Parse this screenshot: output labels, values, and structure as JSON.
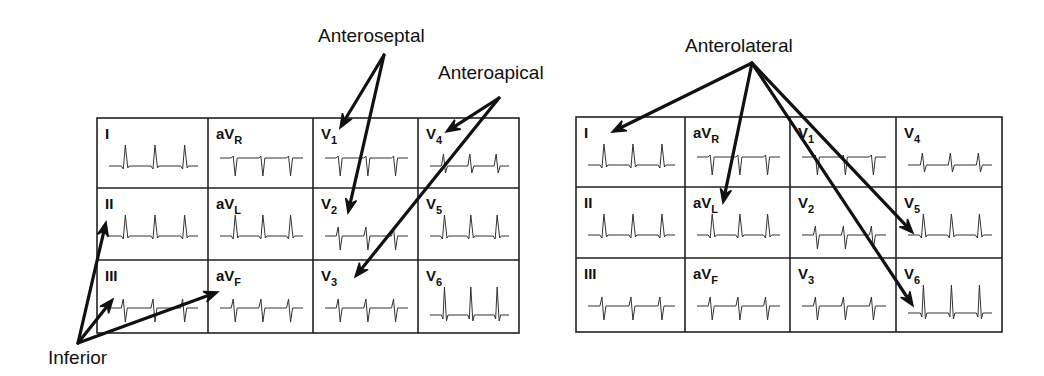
{
  "figure": {
    "panels": [
      {
        "id": "left",
        "grid": {
          "x": 97,
          "y": 118,
          "width": 422,
          "height": 215,
          "col_x": [
            97,
            208,
            313,
            418,
            519
          ],
          "row_y": [
            118,
            188,
            260,
            333
          ]
        },
        "leads": [
          {
            "label": "I",
            "sub": "",
            "row": 0,
            "col": 0,
            "wave": "upright"
          },
          {
            "label": "aV",
            "sub": "R",
            "row": 0,
            "col": 1,
            "wave": "inverted"
          },
          {
            "label": "V",
            "sub": "1",
            "row": 0,
            "col": 2,
            "wave": "inverted"
          },
          {
            "label": "V",
            "sub": "4",
            "row": 0,
            "col": 3,
            "wave": "biphasic_small"
          },
          {
            "label": "II",
            "sub": "",
            "row": 1,
            "col": 0,
            "wave": "upright"
          },
          {
            "label": "aV",
            "sub": "L",
            "row": 1,
            "col": 1,
            "wave": "upright"
          },
          {
            "label": "V",
            "sub": "2",
            "row": 1,
            "col": 2,
            "wave": "rS"
          },
          {
            "label": "V",
            "sub": "5",
            "row": 1,
            "col": 3,
            "wave": "upright"
          },
          {
            "label": "III",
            "sub": "",
            "row": 2,
            "col": 0,
            "wave": "rS"
          },
          {
            "label": "aV",
            "sub": "F",
            "row": 2,
            "col": 1,
            "wave": "rS"
          },
          {
            "label": "V",
            "sub": "3",
            "row": 2,
            "col": 2,
            "wave": "rS"
          },
          {
            "label": "V",
            "sub": "6",
            "row": 2,
            "col": 3,
            "wave": "tall"
          }
        ],
        "region_labels": [
          {
            "text": "Anteroseptal",
            "x": 318,
            "y": 26
          },
          {
            "text": "Anteroapical",
            "x": 438,
            "y": 63
          },
          {
            "text": "Inferior",
            "x": 48,
            "y": 348
          }
        ],
        "arrows": [
          {
            "name": "anteroseptal-to-v1",
            "from": [
              384,
              55
            ],
            "to": [
              340,
              128
            ]
          },
          {
            "name": "anteroseptal-to-v2",
            "from": [
              384,
              55
            ],
            "to": [
              348,
              213
            ]
          },
          {
            "name": "anteroapical-to-v4",
            "from": [
              499,
              98
            ],
            "to": [
              446,
              132
            ]
          },
          {
            "name": "anteroapical-to-v3",
            "from": [
              499,
              98
            ],
            "to": [
              355,
              277
            ]
          },
          {
            "name": "inferior-to-ii",
            "from": [
              78,
              343
            ],
            "to": [
              106,
              222
            ]
          },
          {
            "name": "inferior-to-iii",
            "from": [
              78,
              343
            ],
            "to": [
              113,
              299
            ]
          },
          {
            "name": "inferior-to-avf",
            "from": [
              78,
              343
            ],
            "to": [
              218,
              292
            ]
          }
        ]
      },
      {
        "id": "right",
        "grid": {
          "x": 576,
          "y": 117,
          "width": 426,
          "height": 215,
          "col_x": [
            576,
            685,
            790,
            896,
            1002
          ],
          "row_y": [
            117,
            187,
            258,
            332
          ]
        },
        "leads": [
          {
            "label": "I",
            "sub": "",
            "row": 0,
            "col": 0,
            "wave": "upright"
          },
          {
            "label": "aV",
            "sub": "R",
            "row": 0,
            "col": 1,
            "wave": "inverted"
          },
          {
            "label": "V",
            "sub": "1",
            "row": 0,
            "col": 2,
            "wave": "inverted"
          },
          {
            "label": "V",
            "sub": "4",
            "row": 0,
            "col": 3,
            "wave": "biphasic_small"
          },
          {
            "label": "II",
            "sub": "",
            "row": 1,
            "col": 0,
            "wave": "upright"
          },
          {
            "label": "aV",
            "sub": "L",
            "row": 1,
            "col": 1,
            "wave": "upright"
          },
          {
            "label": "V",
            "sub": "2",
            "row": 1,
            "col": 2,
            "wave": "rS"
          },
          {
            "label": "V",
            "sub": "5",
            "row": 1,
            "col": 3,
            "wave": "upright"
          },
          {
            "label": "III",
            "sub": "",
            "row": 2,
            "col": 0,
            "wave": "rS"
          },
          {
            "label": "aV",
            "sub": "F",
            "row": 2,
            "col": 1,
            "wave": "rS"
          },
          {
            "label": "V",
            "sub": "3",
            "row": 2,
            "col": 2,
            "wave": "rS"
          },
          {
            "label": "V",
            "sub": "6",
            "row": 2,
            "col": 3,
            "wave": "tall"
          }
        ],
        "region_labels": [
          {
            "text": "Anterolateral",
            "x": 685,
            "y": 36
          }
        ],
        "arrows": [
          {
            "name": "anterolateral-to-i",
            "from": [
              752,
              63
            ],
            "to": [
              612,
              132
            ]
          },
          {
            "name": "anterolateral-to-avl",
            "from": [
              752,
              63
            ],
            "to": [
              723,
              203
            ]
          },
          {
            "name": "anterolateral-to-v5",
            "from": [
              752,
              63
            ],
            "to": [
              913,
              233
            ]
          },
          {
            "name": "anterolateral-to-v6",
            "from": [
              752,
              63
            ],
            "to": [
              913,
              306
            ]
          }
        ]
      }
    ]
  }
}
